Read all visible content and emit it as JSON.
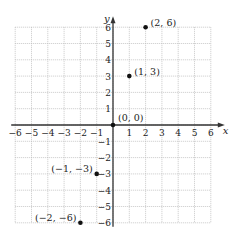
{
  "chart_data": {
    "type": "scatter",
    "title": "",
    "xlabel": "x",
    "ylabel": "y",
    "xlim": [
      -6,
      6
    ],
    "ylim": [
      -6,
      6
    ],
    "grid": true,
    "x_ticks": [
      "−6",
      "−5",
      "−4",
      "−3",
      "−2",
      "−1",
      "1",
      "2",
      "3",
      "4",
      "5",
      "6"
    ],
    "y_ticks": [
      "6",
      "5",
      "4",
      "3",
      "2",
      "1",
      "−1",
      "−2",
      "−3",
      "−4",
      "−5",
      "−6"
    ],
    "points": [
      {
        "x": 2,
        "y": 6,
        "label": "(2, 6)"
      },
      {
        "x": 1,
        "y": 3,
        "label": "(1, 3)"
      },
      {
        "x": 0,
        "y": 0,
        "label": "(0, 0)"
      },
      {
        "x": -1,
        "y": -3,
        "label": "(−1, −3)"
      },
      {
        "x": -2,
        "y": -6,
        "label": "(−2, −6)"
      }
    ]
  }
}
